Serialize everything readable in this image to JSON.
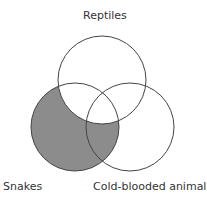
{
  "diagram": {
    "type": "venn",
    "sets": [
      {
        "id": "reptiles",
        "label": "Reptiles",
        "cx": 102,
        "cy": 80,
        "r": 44
      },
      {
        "id": "snakes",
        "label": "Snakes",
        "cx": 75,
        "cy": 127,
        "r": 44
      },
      {
        "id": "cold_blooded",
        "label": "Cold-blooded animals",
        "cx": 130,
        "cy": 127,
        "r": 44
      }
    ],
    "shaded_region": "Snakes outside Reptiles",
    "colors": {
      "stroke": "#444444",
      "shade": "#8c8c8c",
      "background": "#ffffff"
    }
  }
}
